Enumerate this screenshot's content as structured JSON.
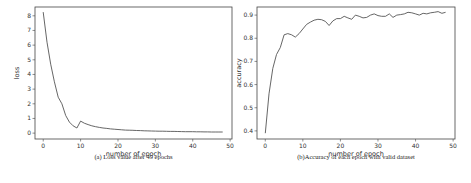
{
  "chart_data": [
    {
      "type": "line",
      "title": "",
      "caption": "(a) Loss value after 49 epochs",
      "xlabel": "number of epoch",
      "ylabel": "loss",
      "xlim": [
        -2.2,
        50.5
      ],
      "ylim": [
        -0.4,
        8.6
      ],
      "xticks": [
        0,
        10,
        20,
        30,
        40,
        50
      ],
      "yticks": [
        0,
        1,
        2,
        3,
        4,
        5,
        6,
        7,
        8
      ],
      "grid": false,
      "x": [
        0,
        1,
        2,
        3,
        4,
        5,
        6,
        7,
        8,
        9,
        10,
        11,
        12,
        13,
        14,
        15,
        16,
        17,
        18,
        19,
        20,
        21,
        22,
        23,
        24,
        25,
        26,
        27,
        28,
        29,
        30,
        31,
        32,
        33,
        34,
        35,
        36,
        37,
        38,
        39,
        40,
        41,
        42,
        43,
        44,
        45,
        46,
        47,
        48
      ],
      "values": [
        8.25,
        6.2,
        4.7,
        3.5,
        2.45,
        2.0,
        1.2,
        0.75,
        0.5,
        0.35,
        0.82,
        0.68,
        0.58,
        0.5,
        0.44,
        0.39,
        0.35,
        0.32,
        0.29,
        0.27,
        0.25,
        0.23,
        0.21,
        0.2,
        0.19,
        0.18,
        0.17,
        0.16,
        0.15,
        0.145,
        0.14,
        0.135,
        0.13,
        0.125,
        0.12,
        0.115,
        0.11,
        0.105,
        0.1,
        0.1,
        0.095,
        0.09,
        0.09,
        0.085,
        0.085,
        0.08,
        0.08,
        0.075,
        0.075
      ]
    },
    {
      "type": "line",
      "title": "",
      "caption": "(b)Accuracy of each epoch with valid dataset",
      "xlabel": "number of epoch",
      "ylabel": "accuracy",
      "xlim": [
        -2.2,
        50.5
      ],
      "ylim": [
        0.365,
        0.935
      ],
      "xticks": [
        0,
        10,
        20,
        30,
        40,
        50
      ],
      "yticks": [
        0.4,
        0.5,
        0.6,
        0.7,
        0.8,
        0.9
      ],
      "grid": false,
      "x": [
        0,
        1,
        2,
        3,
        4,
        5,
        6,
        7,
        8,
        9,
        10,
        11,
        12,
        13,
        14,
        15,
        16,
        17,
        18,
        19,
        20,
        21,
        22,
        23,
        24,
        25,
        26,
        27,
        28,
        29,
        30,
        31,
        32,
        33,
        34,
        35,
        36,
        37,
        38,
        39,
        40,
        41,
        42,
        43,
        44,
        45,
        46,
        47,
        48
      ],
      "values": [
        0.39,
        0.56,
        0.67,
        0.73,
        0.76,
        0.815,
        0.82,
        0.815,
        0.805,
        0.82,
        0.84,
        0.86,
        0.87,
        0.878,
        0.882,
        0.88,
        0.873,
        0.855,
        0.875,
        0.885,
        0.885,
        0.895,
        0.888,
        0.882,
        0.9,
        0.895,
        0.888,
        0.89,
        0.9,
        0.905,
        0.898,
        0.895,
        0.895,
        0.905,
        0.89,
        0.9,
        0.902,
        0.905,
        0.912,
        0.91,
        0.905,
        0.9,
        0.908,
        0.905,
        0.91,
        0.912,
        0.915,
        0.908,
        0.912
      ]
    }
  ]
}
